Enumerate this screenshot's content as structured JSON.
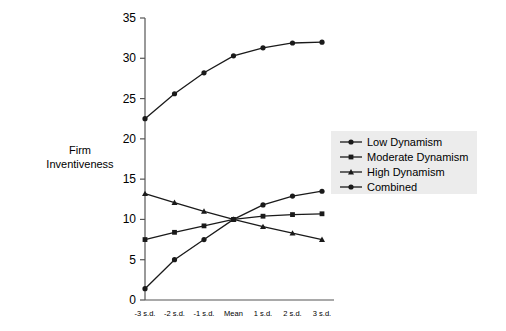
{
  "chart_data": {
    "type": "line",
    "title": "",
    "xlabel": "",
    "ylabel": "Firm Inventiveness",
    "categories": [
      "-3 s.d.",
      "-2 s.d.",
      "-1 s.d.",
      "Mean",
      "1 s.d.",
      "2 s.d.",
      "3 s.d."
    ],
    "ylim": [
      0,
      35
    ],
    "yticks": [
      0,
      5,
      10,
      15,
      20,
      25,
      30,
      35
    ],
    "ytick_labels": [
      "0",
      "5",
      "10",
      "15",
      "20",
      "25",
      "30",
      "35"
    ],
    "grid": false,
    "legend_position": "right",
    "series": [
      {
        "name": "Low Dynamism",
        "marker": "circle",
        "values": [
          1.4,
          5.0,
          7.5,
          10.0,
          11.8,
          12.9,
          13.5
        ]
      },
      {
        "name": "Moderate Dynamism",
        "marker": "square",
        "values": [
          7.5,
          8.4,
          9.2,
          10.0,
          10.4,
          10.6,
          10.7
        ]
      },
      {
        "name": "High Dynamism",
        "marker": "triangle",
        "values": [
          13.2,
          12.1,
          11.0,
          10.0,
          9.1,
          8.3,
          7.5
        ]
      },
      {
        "name": "Combined",
        "marker": "circle",
        "values": [
          22.5,
          25.6,
          28.2,
          30.3,
          31.3,
          31.9,
          32.0
        ]
      }
    ]
  },
  "axis": {
    "y_label_line1": "Firm",
    "y_label_line2": "Inventiveness"
  },
  "colors": {
    "line": "#1a1a1a",
    "axis": "#555555",
    "legend_background": "#ececec",
    "text": "#000000"
  }
}
